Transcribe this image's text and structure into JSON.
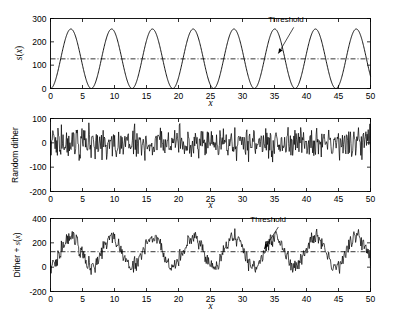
{
  "figure": {
    "background": "#ffffff",
    "line_color": "#000000",
    "width": 395,
    "height": 318
  },
  "chart_data": [
    {
      "id": "panel-signal",
      "type": "line",
      "title": "",
      "xlabel": "x",
      "ylabel": "s(x)",
      "xlim": [
        0,
        50
      ],
      "ylim": [
        0,
        300
      ],
      "xticks": [
        0,
        5,
        10,
        15,
        20,
        25,
        30,
        35,
        40,
        45,
        50
      ],
      "yticks": [
        0,
        100,
        200,
        300
      ],
      "grid": false,
      "series": [
        {
          "name": "s(x)",
          "style": "solid",
          "description": "sinusoid, amplitude 127.5, offset 127.5, period 6.37",
          "amplitude": 127.5,
          "offset": 127.5,
          "period": 6.37,
          "phase": 0.0,
          "x_start": 0,
          "x_end": 50,
          "samples": 1000
        }
      ],
      "reference_lines": [
        {
          "name": "threshold",
          "orientation": "horizontal",
          "value": 127,
          "style": "dash-dot"
        }
      ],
      "annotations": [
        {
          "text": "Threshold",
          "text_x": 36.8,
          "text_y": 283,
          "arrow_from_x": 38.0,
          "arrow_from_y": 262,
          "arrow_to_x": 35.6,
          "arrow_to_y": 150
        }
      ]
    },
    {
      "id": "panel-dither",
      "type": "line",
      "title": "",
      "xlabel": "x",
      "ylabel": "Random dither",
      "xlim": [
        0,
        50
      ],
      "ylim": [
        -200,
        100
      ],
      "xticks": [
        0,
        5,
        10,
        15,
        20,
        25,
        30,
        35,
        40,
        45,
        50
      ],
      "yticks": [
        -200,
        -100,
        0,
        100
      ],
      "grid": false,
      "series": [
        {
          "name": "Random dither",
          "style": "solid",
          "description": "zero-mean random noise",
          "mean": 0,
          "typical_range": [
            -60,
            60
          ],
          "extreme_range": [
            -110,
            90
          ],
          "samples": 500,
          "seed": 7
        }
      ],
      "reference_lines": [],
      "annotations": []
    },
    {
      "id": "panel-sum",
      "type": "line",
      "title": "",
      "xlabel": "x",
      "ylabel": "Dither + s(x)",
      "xlim": [
        0,
        50
      ],
      "ylim": [
        -200,
        400
      ],
      "xticks": [
        0,
        5,
        10,
        15,
        20,
        25,
        30,
        35,
        40,
        45,
        50
      ],
      "yticks": [
        -200,
        0,
        200,
        400
      ],
      "grid": false,
      "series": [
        {
          "name": "Dither + s(x)",
          "style": "solid",
          "description": "sum of sinusoid s(x) and random dither",
          "amplitude": 127.5,
          "offset": 127.5,
          "period": 6.37,
          "noise_range": [
            -60,
            60
          ],
          "samples": 500,
          "seed": 7
        }
      ],
      "reference_lines": [
        {
          "name": "threshold",
          "orientation": "horizontal",
          "value": 127,
          "style": "dash-dot"
        }
      ],
      "annotations": [
        {
          "text": "Threshold",
          "text_x": 34.0,
          "text_y": 372,
          "arrow_from_x": 35.6,
          "arrow_from_y": 330,
          "arrow_to_x": 33.4,
          "arrow_to_y": 150
        }
      ]
    }
  ]
}
